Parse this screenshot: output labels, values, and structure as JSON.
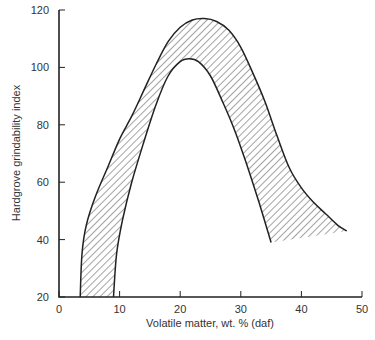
{
  "chart_data": {
    "type": "area",
    "title": "",
    "xlabel": "Volatile matter, wt. % (daf)",
    "ylabel": "Hardgrove grindability index",
    "xlim": [
      0,
      50
    ],
    "ylim": [
      20,
      120
    ],
    "x_ticks": [
      0,
      10,
      20,
      30,
      40,
      50
    ],
    "y_ticks": [
      20,
      40,
      60,
      80,
      100,
      120
    ],
    "grid": false,
    "legend": null,
    "fill_style": "diagonal hatch",
    "series": [
      {
        "name": "Upper boundary",
        "points": [
          [
            3.5,
            20
          ],
          [
            3.8,
            35
          ],
          [
            4.5,
            45
          ],
          [
            6,
            55
          ],
          [
            8,
            65
          ],
          [
            10,
            75
          ],
          [
            12,
            83
          ],
          [
            14,
            92
          ],
          [
            16,
            101
          ],
          [
            18,
            109
          ],
          [
            20,
            114
          ],
          [
            22,
            116.5
          ],
          [
            24,
            117
          ],
          [
            26,
            116
          ],
          [
            28,
            113
          ],
          [
            30,
            107
          ],
          [
            32,
            98
          ],
          [
            34,
            88
          ],
          [
            36,
            76
          ],
          [
            38,
            65
          ],
          [
            40,
            58
          ],
          [
            42,
            53
          ],
          [
            44,
            49
          ],
          [
            46,
            45
          ],
          [
            47.5,
            43
          ]
        ]
      },
      {
        "name": "Lower boundary",
        "points": [
          [
            9,
            20
          ],
          [
            9.5,
            35
          ],
          [
            10.5,
            47
          ],
          [
            12,
            60
          ],
          [
            14,
            74
          ],
          [
            16,
            87
          ],
          [
            18,
            97
          ],
          [
            20,
            102
          ],
          [
            21.5,
            103
          ],
          [
            23,
            102
          ],
          [
            25,
            97
          ],
          [
            27,
            88
          ],
          [
            29,
            78
          ],
          [
            31,
            66
          ],
          [
            33,
            53
          ],
          [
            35,
            39
          ]
        ]
      }
    ]
  },
  "axes": {
    "x_title": "Volatile matter, wt. % (daf)",
    "y_title": "Hardgrove grindability index",
    "x_tick_labels": [
      "0",
      "10",
      "20",
      "30",
      "40",
      "50"
    ],
    "y_tick_labels": [
      "20",
      "40",
      "60",
      "80",
      "100",
      "120"
    ]
  }
}
